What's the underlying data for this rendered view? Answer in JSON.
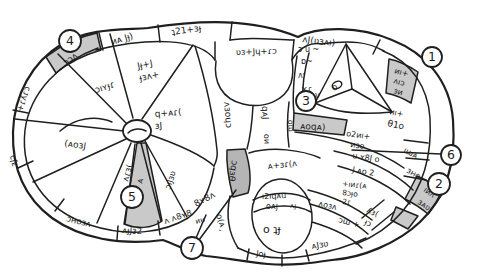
{
  "figure": {
    "ink_color": "#1f1f1f",
    "paper_color": "#ffffff",
    "shade_color": "#c9c9c9",
    "dark_shade_color": "#b5b5b5"
  },
  "callouts": {
    "n1": "1",
    "n2": "2",
    "n3": "3",
    "n4": "4",
    "n5": "5",
    "n6": "6",
    "n7": "7"
  },
  "labels": {
    "t1": "ɔɔʌ",
    "t2": "иᴀ Jɟ)",
    "t3": "ʇ21+ɜɟ",
    "t4": "ʌJ(ʋɜʌı)",
    "t5": "ʋɜ+Jɥ+ɾɔ",
    "r1": "+ɾʎɾɔ",
    "r2": "ɜJɔ",
    "r3": "ɔʜoɜʌ",
    "r4": "ᴀɟJɜ2",
    "r5": "ʌ ʌ8ʏ8",
    "r6": "иʜ",
    "w1a": "Jɟ+J",
    "w1b": "ɟɜʌ+",
    "w2": "ɔıʏɟɾ",
    "w3": "(ᴀoɜJ",
    "w4a": "q+ᴀɾ(",
    "w4b": "ɜJ",
    "w5a": "ʌɾɜ(",
    "w5b": "ᴀ",
    "w6": "ɔıJɜʋ",
    "c1": "ʌɜoɥɔ",
    "c2": "qᴀJ",
    "c3": "oи",
    "c4": "oɯ",
    "s1": "ɔ u ~",
    "s2": "ɒ~",
    "s3": "ʌʳ",
    "s4": "×ɾ",
    "s5": "v",
    "g4": "ᴀoqᴀ)",
    "rr1a": "o2иı+",
    "rr1b": "иɜo",
    "rr2": "u ʏ8J o",
    "rr3": "ıɯᴀ",
    "rr4": "J ᴀo 2",
    "rr5": "ɜʜo",
    "g5a": "иı+",
    "g5b": "ʌıɔ",
    "g5c": "ɜи",
    "q1a": "иı+",
    "q1b": "θ1o",
    "g6a": "ıиʌ",
    "g6b": "ɜᴀʋ",
    "bk1": "+ıиɾ(ᴀ",
    "bk2": "8ɔɟo",
    "bk3": "2ɾ",
    "rw1": "ʌoɜʌ",
    "rw2": "ɔɯ +",
    "rw3": "ʎɜ(",
    "rw4": "ɟɔ",
    "rw5": "ᴀJɜʋ",
    "rw6": "Joɟ",
    "ov1": "ᴀ+ɜɾ(ʌ",
    "ov2": "ı2ıqᴀu",
    "ov3": "oᴀɟ",
    "ov4": "ᴀɟ",
    "ov5": "o ʇɟ",
    "ov6": "o(ᴀ¸",
    "ov7": "8ʏ8ʌ",
    "db": "ɔqɜθ",
    "tri": "o"
  }
}
